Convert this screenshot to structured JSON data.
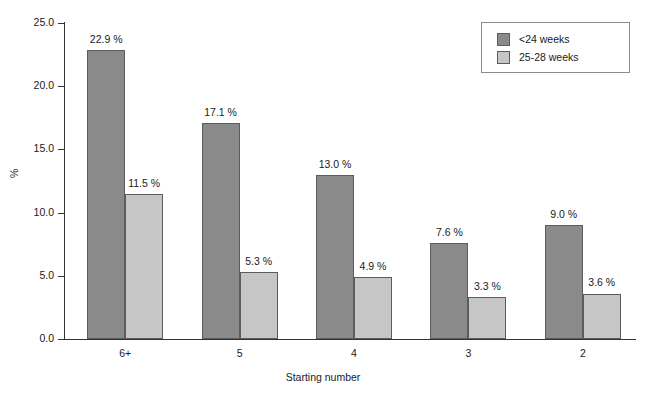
{
  "chart_data": {
    "type": "bar",
    "title": "",
    "subtitle": "",
    "xlabel": "Starting number",
    "ylabel": "%",
    "categories": [
      "6+",
      "5",
      "4",
      "3",
      "2"
    ],
    "series": [
      {
        "name": "<24 weeks",
        "color": "#8a8a8a",
        "values": [
          22.9,
          17.1,
          13.0,
          7.6,
          9.0
        ],
        "labels": [
          "22.9 %",
          "17.1 %",
          "13.0 %",
          "7.6 %",
          "9.0 %"
        ]
      },
      {
        "name": "25-28 weeks",
        "color": "#c6c6c6",
        "values": [
          11.5,
          5.3,
          4.9,
          3.3,
          3.6
        ],
        "labels": [
          "11.5 %",
          "5.3 %",
          "4.9 %",
          "3.3 %",
          "3.6 %"
        ]
      }
    ],
    "ylim": [
      0.0,
      25.0
    ],
    "yticks": [
      0.0,
      5.0,
      10.0,
      15.0,
      20.0,
      25.0
    ],
    "ytick_labels": [
      "0.0",
      "5.0",
      "10.0",
      "15.0",
      "20.0",
      "25.0"
    ],
    "grid": false,
    "legend_position": "top-right",
    "value_label_suffix": " %"
  },
  "legend": {
    "entries": [
      {
        "label": "<24 weeks",
        "color": "#8a8a8a"
      },
      {
        "label": "25-28 weeks",
        "color": "#c6c6c6"
      }
    ]
  }
}
